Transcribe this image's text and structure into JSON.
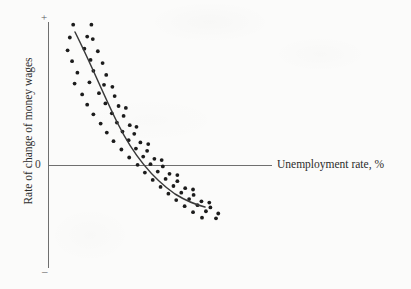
{
  "chart_data": {
    "type": "scatter",
    "title": "",
    "subtitle": "",
    "xlabel": "Unemployment rate, %",
    "ylabel": "Rate of change of money wages",
    "grid": false,
    "legend": null,
    "annotations": [],
    "axis_markers": {
      "y_positive": "+",
      "y_origin": "0",
      "y_negative": "–"
    },
    "axis_ranges": {
      "x": [
        0,
        10
      ],
      "y": [
        -1,
        1
      ]
    },
    "origin_label": "0",
    "series": [
      {
        "name": "Observations",
        "type": "scatter",
        "marker": "filled-circle",
        "color": "#1c1c1c",
        "points": [
          [
            0.9,
            0.88
          ],
          [
            1.55,
            0.88
          ],
          [
            0.78,
            0.8
          ],
          [
            1.4,
            0.806
          ],
          [
            1.6,
            0.79
          ],
          [
            0.7,
            0.72
          ],
          [
            1.3,
            0.73
          ],
          [
            1.78,
            0.714
          ],
          [
            0.86,
            0.652
          ],
          [
            1.52,
            0.66
          ],
          [
            1.95,
            0.64
          ],
          [
            1.05,
            0.58
          ],
          [
            1.62,
            0.592
          ],
          [
            2.08,
            0.566
          ],
          [
            0.95,
            0.512
          ],
          [
            1.48,
            0.52
          ],
          [
            2.0,
            0.504
          ],
          [
            2.3,
            0.492
          ],
          [
            1.22,
            0.444
          ],
          [
            1.82,
            0.452
          ],
          [
            2.38,
            0.434
          ],
          [
            1.4,
            0.38
          ],
          [
            2.05,
            0.388
          ],
          [
            2.52,
            0.372
          ],
          [
            2.78,
            0.36
          ],
          [
            1.62,
            0.32
          ],
          [
            2.28,
            0.326
          ],
          [
            2.7,
            0.31
          ],
          [
            1.88,
            0.262
          ],
          [
            2.46,
            0.268
          ],
          [
            2.92,
            0.252
          ],
          [
            3.16,
            0.242
          ],
          [
            2.1,
            0.206
          ],
          [
            2.66,
            0.212
          ],
          [
            3.08,
            0.198
          ],
          [
            2.34,
            0.152
          ],
          [
            2.88,
            0.158
          ],
          [
            3.3,
            0.144
          ],
          [
            3.58,
            0.134
          ],
          [
            2.62,
            0.1
          ],
          [
            3.14,
            0.106
          ],
          [
            3.54,
            0.092
          ],
          [
            2.9,
            0.05
          ],
          [
            3.4,
            0.056
          ],
          [
            3.8,
            0.042
          ],
          [
            4.06,
            0.034
          ],
          [
            3.2,
            0.004
          ],
          [
            3.66,
            0.008
          ],
          [
            4.1,
            -0.006
          ],
          [
            3.46,
            -0.044
          ],
          [
            3.92,
            -0.038
          ],
          [
            4.34,
            -0.052
          ],
          [
            4.62,
            -0.06
          ],
          [
            3.74,
            -0.09
          ],
          [
            4.2,
            -0.084
          ],
          [
            4.62,
            -0.098
          ],
          [
            4.02,
            -0.134
          ],
          [
            4.48,
            -0.128
          ],
          [
            4.9,
            -0.142
          ],
          [
            5.18,
            -0.15
          ],
          [
            4.3,
            -0.176
          ],
          [
            4.76,
            -0.17
          ],
          [
            5.2,
            -0.184
          ],
          [
            4.58,
            -0.216
          ],
          [
            5.04,
            -0.21
          ],
          [
            5.48,
            -0.224
          ],
          [
            5.76,
            -0.232
          ],
          [
            4.88,
            -0.254
          ],
          [
            5.34,
            -0.248
          ],
          [
            5.8,
            -0.262
          ],
          [
            5.18,
            -0.292
          ],
          [
            5.64,
            -0.286
          ],
          [
            6.08,
            -0.3
          ],
          [
            5.5,
            -0.326
          ],
          [
            6.0,
            -0.33
          ]
        ]
      },
      {
        "name": "Fitted Phillips curve",
        "type": "line",
        "color": "#3a3a3a",
        "description": "downward-sloping convex curve fitted through the scatter"
      }
    ]
  },
  "labels": {
    "x_axis_title": "Unemployment rate, %",
    "y_axis_title": "Rate of change of money wages",
    "y_plus": "+",
    "y_zero": "0",
    "y_minus": "–"
  },
  "colors": {
    "background": "#fbfbfa",
    "axis": "#6f6f6f",
    "curve": "#3a3a3a",
    "dots": "#1c1c1c",
    "text": "#2b2b2b"
  }
}
